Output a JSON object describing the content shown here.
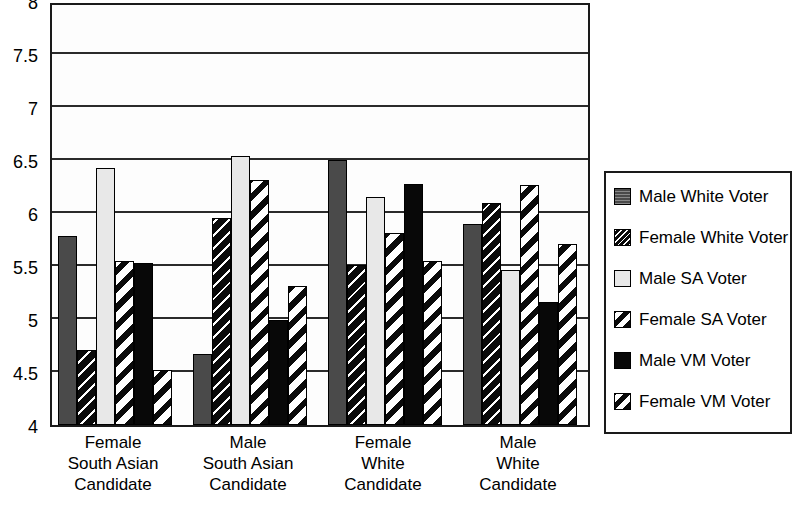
{
  "chart_data": {
    "type": "bar",
    "title": "",
    "subtitle": "",
    "xlabel": "",
    "ylabel": "",
    "ylim": [
      4,
      8
    ],
    "ytick_step": 0.5,
    "ytick_labels": [
      "8",
      "7.5",
      "7",
      "6.5",
      "6",
      "5.5",
      "5",
      "4.5",
      "4"
    ],
    "ytick_values": [
      8,
      7.5,
      7,
      6.5,
      6,
      5.5,
      5,
      4.5,
      4
    ],
    "grid": true,
    "legend_position": "right",
    "categories": [
      "Female South Asian Candidate",
      "Male South Asian Candidate",
      "Female White Candidate",
      "Male White Candidate"
    ],
    "category_lines": [
      [
        "Female",
        "South Asian",
        "Candidate"
      ],
      [
        "Male",
        "South Asian",
        "Candidate"
      ],
      [
        "Female",
        "White",
        "Candidate"
      ],
      [
        "Male",
        "White",
        "Candidate"
      ]
    ],
    "series": [
      {
        "name": "Male White Voter",
        "key": "mwv",
        "values": [
          5.78,
          4.67,
          6.5,
          5.9
        ]
      },
      {
        "name": "Female White Voter",
        "key": "fwv",
        "values": [
          4.71,
          5.95,
          5.51,
          6.09
        ]
      },
      {
        "name": "Male SA Voter",
        "key": "msa",
        "values": [
          6.42,
          6.54,
          6.15,
          5.46
        ]
      },
      {
        "name": "Female SA Voter",
        "key": "fsa",
        "values": [
          5.55,
          6.31,
          5.81,
          6.26
        ]
      },
      {
        "name": "Male VM Voter",
        "key": "mvm",
        "values": [
          5.53,
          4.99,
          6.27,
          5.16
        ]
      },
      {
        "name": "Female VM Voter",
        "key": "fvm",
        "values": [
          4.52,
          5.31,
          5.55,
          5.71
        ]
      }
    ]
  },
  "legend": {
    "items": [
      {
        "label": "Male White Voter",
        "key": "mwv",
        "color": "#4a4a4a"
      },
      {
        "label": "Female White Voter",
        "key": "fwv",
        "color": "#0a0a0a"
      },
      {
        "label": "Male SA Voter",
        "key": "msa",
        "color": "#e8e8e8"
      },
      {
        "label": "Female SA Voter",
        "key": "fsa",
        "color": "#ffffff"
      },
      {
        "label": "Male VM Voter",
        "key": "mvm",
        "color": "#080808"
      },
      {
        "label": "Female VM Voter",
        "key": "fvm",
        "color": "#ffffff"
      }
    ]
  }
}
